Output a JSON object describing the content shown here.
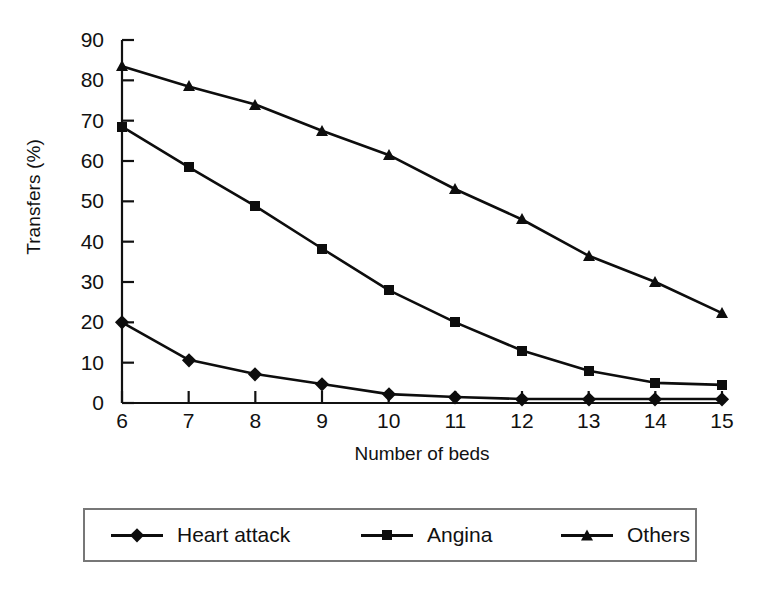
{
  "chart_data": {
    "type": "line",
    "title": "",
    "xlabel": "Number of beds",
    "ylabel": "Transfers (%)",
    "x": [
      6,
      7,
      8,
      9,
      10,
      11,
      12,
      13,
      14,
      15
    ],
    "xtick_labels": [
      "6",
      "7",
      "8",
      "9",
      "10",
      "11",
      "12",
      "13",
      "14",
      "15"
    ],
    "ytick_labels": [
      "90",
      "80",
      "70",
      "60",
      "50",
      "40",
      "30",
      "20",
      "10",
      "0"
    ],
    "yticks": [
      90,
      80,
      70,
      60,
      50,
      40,
      30,
      20,
      10,
      0
    ],
    "xlim": [
      6,
      15
    ],
    "ylim": [
      0,
      90
    ],
    "grid": false,
    "legend_position": "below-plot",
    "series": [
      {
        "name": "Heart attack",
        "marker": "diamond",
        "color": "#0d0d0d",
        "values": [
          20,
          10.7,
          7.2,
          4.7,
          2.2,
          1.5,
          1,
          1,
          1,
          1
        ]
      },
      {
        "name": "Angina",
        "marker": "square",
        "color": "#0d0d0d",
        "values": [
          68.5,
          58.5,
          48.8,
          38.3,
          28,
          20,
          13,
          8,
          5,
          4.5
        ]
      },
      {
        "name": "Others",
        "marker": "triangle",
        "color": "#0d0d0d",
        "values": [
          83.5,
          78.5,
          74,
          67.5,
          61.5,
          53,
          45.5,
          36.5,
          30,
          22.3
        ]
      }
    ]
  },
  "legend": {
    "entries": [
      {
        "label": "Heart attack",
        "marker": "diamond"
      },
      {
        "label": "Angina",
        "marker": "square"
      },
      {
        "label": "Others",
        "marker": "triangle"
      }
    ]
  }
}
